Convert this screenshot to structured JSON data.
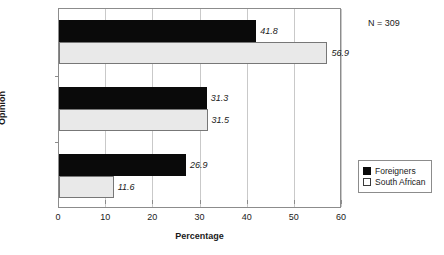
{
  "chart_data": {
    "type": "bar",
    "orientation": "horizontal",
    "title": "",
    "xlabel": "Percentage",
    "ylabel": "Opinion",
    "categories": [
      "Against",
      "For",
      "Unsure"
    ],
    "series": [
      {
        "name": "Foreigners",
        "values": [
          41.8,
          31.3,
          26.9
        ],
        "color": "#0a0a0a"
      },
      {
        "name": "South African",
        "values": [
          56.9,
          31.5,
          11.6
        ],
        "color": "#e9e9e9"
      }
    ],
    "xlim": [
      0,
      60
    ],
    "xticks": [
      0,
      10,
      20,
      30,
      40,
      50,
      60
    ],
    "xtick_labels": [
      "0",
      "10",
      "20",
      "30",
      "40",
      "50",
      "60"
    ],
    "grid": true,
    "grid_axis": "x",
    "legend_position": "right",
    "data_labels": [
      {
        "category": "Against",
        "series": "Foreigners",
        "text": "41.8"
      },
      {
        "category": "Against",
        "series": "South African",
        "text": "56.9"
      },
      {
        "category": "For",
        "series": "Foreigners",
        "text": "31.3"
      },
      {
        "category": "For",
        "series": "South African",
        "text": "31.5"
      },
      {
        "category": "Unsure",
        "series": "Foreigners",
        "text": "26.9"
      },
      {
        "category": "Unsure",
        "series": "South African",
        "text": "11.6"
      }
    ],
    "annotations": [
      {
        "name": "sample-size",
        "text": "N = 309"
      }
    ]
  }
}
